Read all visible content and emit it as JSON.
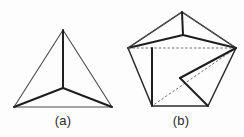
{
  "figure": {
    "background_color": "#fdfdfd",
    "line_color": "#1e1e1e",
    "thin_line_color": "#4a4a4a",
    "dashed_line_color": "#6f6f6f",
    "panels": [
      {
        "id": "panel-a",
        "caption": "(a)",
        "description": "Equilateral triangle with three lines from vertices meeting at an interior point, forming a Y-junction",
        "vertices": {
          "apex": [
            63,
            30
          ],
          "bottom_left": [
            14,
            107
          ],
          "bottom_right": [
            112,
            107
          ],
          "center": [
            63,
            88
          ]
        }
      },
      {
        "id": "panel-b",
        "caption": "(b)",
        "description": "Pentagon outline with folded inner creases, a top peak, a dashed horizontal chord, a dashed diagonal, and a V-shaped fold at lower right",
        "vertices": {
          "top_apex": [
            182,
            12
          ],
          "upper_left": [
            128,
            48
          ],
          "upper_right": [
            236,
            48
          ],
          "bottom_left": [
            152,
            106
          ],
          "bottom_right": [
            208,
            106
          ],
          "inner_peak": [
            183,
            35
          ],
          "fold_vertex": [
            180,
            78
          ]
        }
      }
    ]
  },
  "captions": {
    "a": "(a)",
    "b": "(b)"
  }
}
